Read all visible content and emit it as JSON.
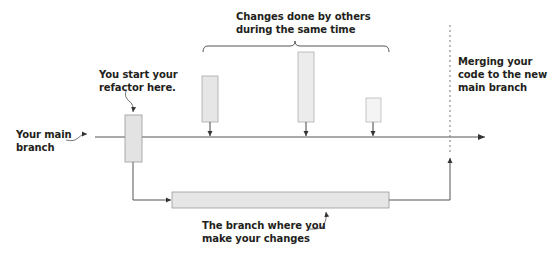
{
  "diagram": {
    "colors": {
      "line": "#555555",
      "box_fill": "#e6e6e6",
      "box_stroke": "#9a9a9a",
      "text": "#231f20"
    },
    "labels": {
      "main_branch": [
        "Your main",
        "branch"
      ],
      "start_refactor": [
        "You start your",
        "refactor here."
      ],
      "others_changes": [
        "Changes done by others",
        "during the same time"
      ],
      "merging": [
        "Merging your",
        "code to the new",
        "main branch"
      ],
      "your_branch": [
        "The branch where you",
        "make your changes"
      ]
    },
    "nodes": [
      {
        "id": "refactor-start",
        "x": 125,
        "y": 115,
        "w": 17,
        "h": 47
      },
      {
        "id": "other-change-1",
        "x": 202,
        "y": 76,
        "w": 16,
        "h": 46
      },
      {
        "id": "other-change-2",
        "x": 298,
        "y": 52,
        "w": 16,
        "h": 70
      },
      {
        "id": "other-change-3",
        "x": 366,
        "y": 98,
        "w": 15,
        "h": 24
      },
      {
        "id": "your-branch-work",
        "x": 172,
        "y": 192,
        "w": 217,
        "h": 16
      }
    ],
    "edges": [
      {
        "from": "main-branch-start",
        "to": "main-branch-end"
      },
      {
        "from": "other-change-1",
        "to": "main-branch"
      },
      {
        "from": "other-change-2",
        "to": "main-branch"
      },
      {
        "from": "other-change-3",
        "to": "main-branch"
      },
      {
        "from": "refactor-start",
        "to": "your-branch-work"
      },
      {
        "from": "your-branch-work",
        "to": "merge-point"
      }
    ]
  }
}
